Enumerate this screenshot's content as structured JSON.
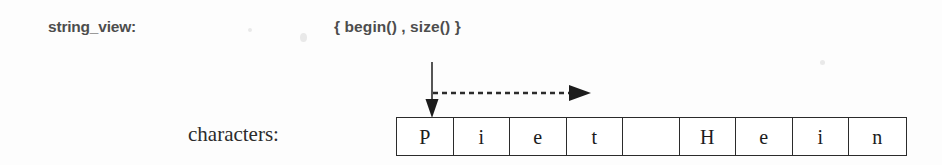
{
  "diagram": {
    "width": 942,
    "height": 165,
    "background_color": "#fdfdfd",
    "ink_color": "#2b2b2b",
    "label_color": "#4d4d4d"
  },
  "string_view_row": {
    "label": "string_view:",
    "value": "{ begin() , size() }"
  },
  "characters_row": {
    "label": "characters:",
    "cells": [
      {
        "char": "P"
      },
      {
        "char": "i"
      },
      {
        "char": "e"
      },
      {
        "char": "t"
      },
      {
        "char": ""
      },
      {
        "char": "H"
      },
      {
        "char": "e"
      },
      {
        "char": "i"
      },
      {
        "char": "n"
      }
    ]
  },
  "annotations": {
    "begin_pointer": {
      "icon": "down-arrow-icon",
      "target_cell_index": 0,
      "x": 432,
      "y_start": 62,
      "y_end": 117
    },
    "size_extent": {
      "icon": "dashed-right-arrow-icon",
      "x_start": 432,
      "x_end": 590,
      "y": 93,
      "style": "dashed"
    }
  }
}
